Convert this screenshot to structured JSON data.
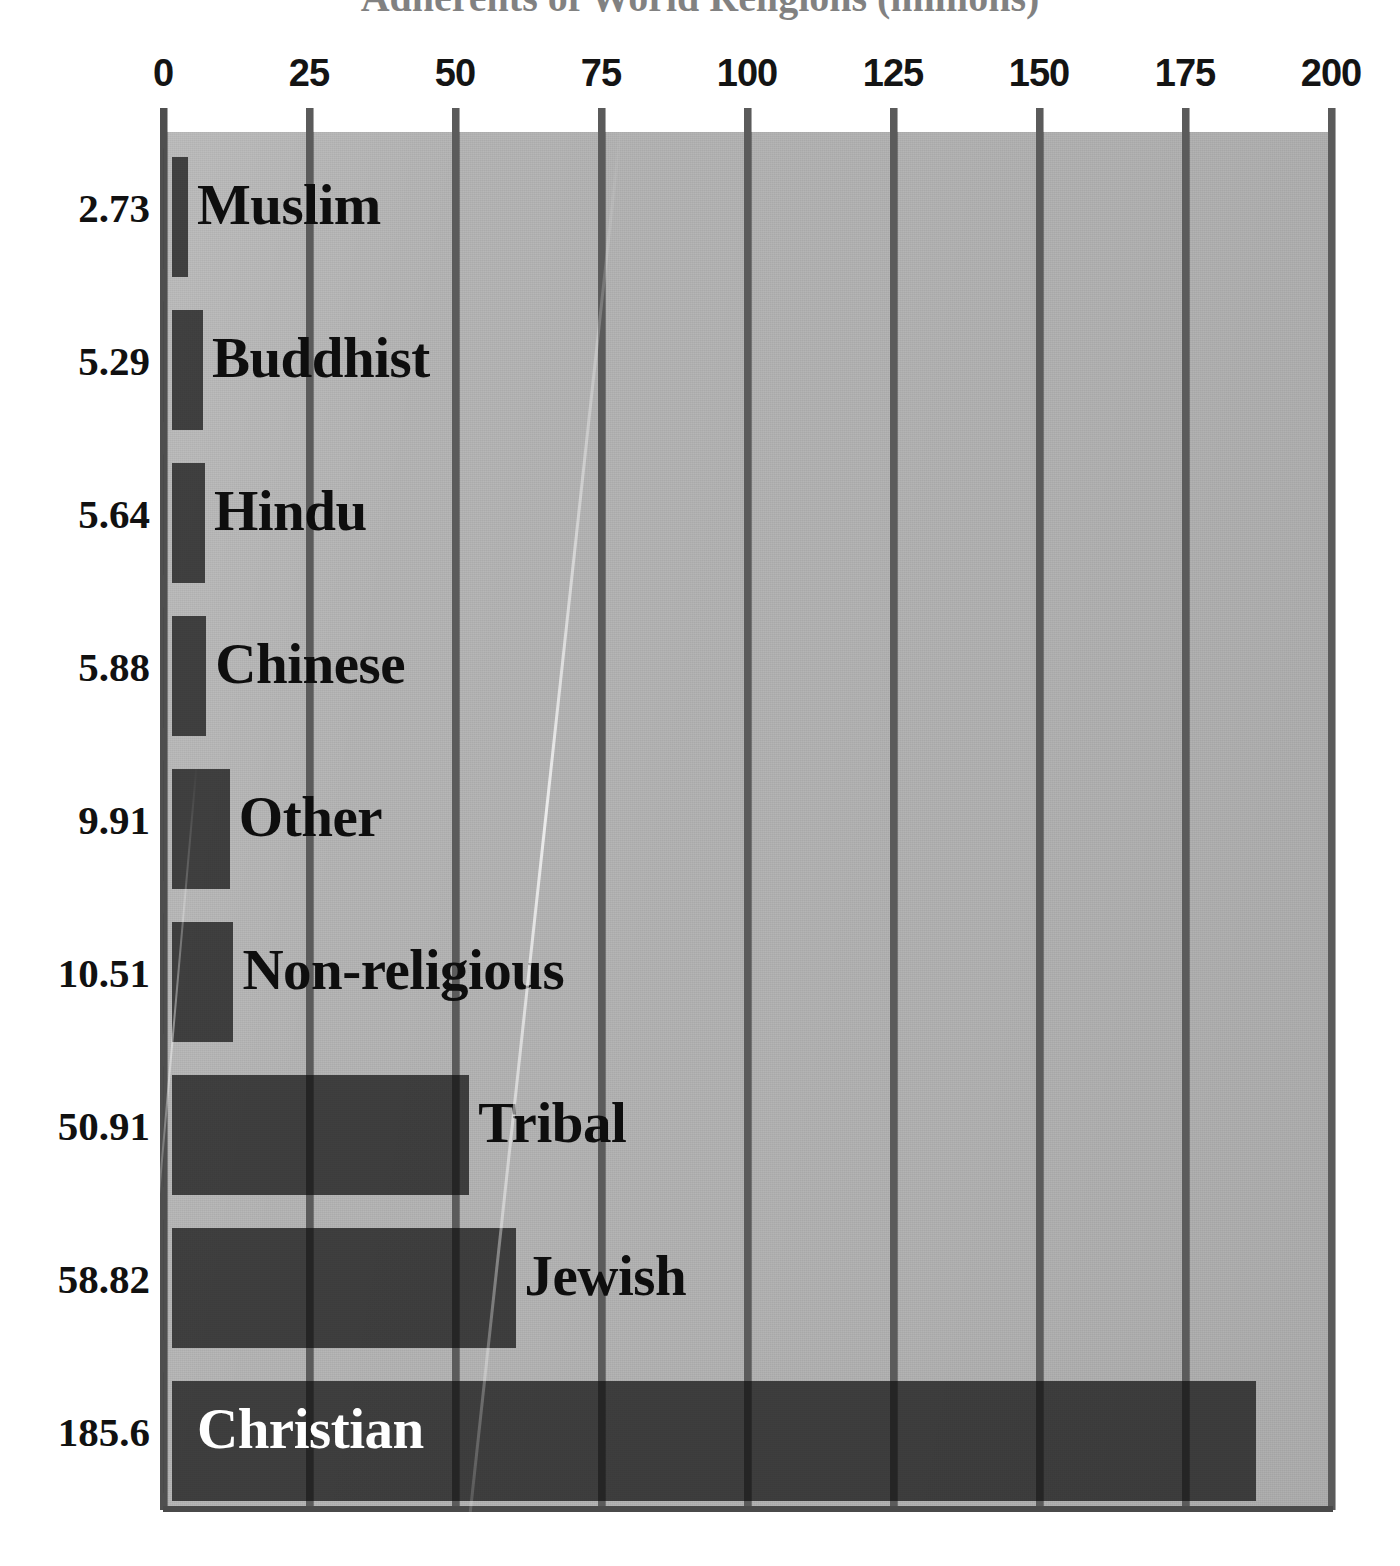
{
  "chart_data": {
    "type": "bar",
    "orientation": "horizontal",
    "title": "Adherents of World Religions (millions)",
    "xlabel": "",
    "ylabel": "",
    "xlim": [
      0,
      200
    ],
    "xticks": [
      "0",
      "25",
      "50",
      "75",
      "100",
      "125",
      "150",
      "175",
      "200"
    ],
    "xtick_values": [
      0,
      25,
      50,
      75,
      100,
      125,
      150,
      175,
      200
    ],
    "grid": true,
    "legend": "none",
    "categories": [
      "Muslim",
      "Buddhist",
      "Hindu",
      "Chinese",
      "Other",
      "Non-religious",
      "Tribal",
      "Jewish",
      "Christian"
    ],
    "values": [
      2.73,
      5.29,
      5.64,
      5.88,
      9.91,
      10.51,
      50.91,
      58.82,
      185.6
    ],
    "value_labels": [
      "2.73",
      "5.29",
      "5.64",
      "5.88",
      "9.91",
      "10.51",
      "50.91",
      "58.82",
      "185.6"
    ],
    "bars": [
      {
        "label": "Muslim",
        "value": 2.73,
        "value_label": "2.73",
        "label_on_bar": false
      },
      {
        "label": "Buddhist",
        "value": 5.29,
        "value_label": "5.29",
        "label_on_bar": false
      },
      {
        "label": "Hindu",
        "value": 5.64,
        "value_label": "5.64",
        "label_on_bar": false
      },
      {
        "label": "Chinese",
        "value": 5.88,
        "value_label": "5.88",
        "label_on_bar": false
      },
      {
        "label": "Other",
        "value": 9.91,
        "value_label": "9.91",
        "label_on_bar": false
      },
      {
        "label": "Non-religious",
        "value": 10.51,
        "value_label": "10.51",
        "label_on_bar": false
      },
      {
        "label": "Tribal",
        "value": 50.91,
        "value_label": "50.91",
        "label_on_bar": false
      },
      {
        "label": "Jewish",
        "value": 58.82,
        "value_label": "58.82",
        "label_on_bar": false
      },
      {
        "label": "Christian",
        "value": 185.6,
        "value_label": "185.6",
        "label_on_bar": true
      }
    ]
  },
  "colors": {
    "bar_fill": "#3b3b3b",
    "bar_shadow": "#111111",
    "plot_background": "#b2b2b2",
    "gridline": "#5b5b5b",
    "page_background": "#ffffff",
    "text": "#111111",
    "text_on_bar": "#ffffff"
  }
}
